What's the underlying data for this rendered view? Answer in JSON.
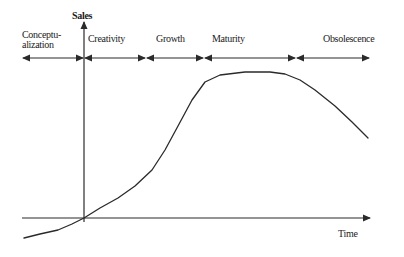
{
  "diagram": {
    "type": "product-life-cycle",
    "axes": {
      "y_label": "Sales",
      "x_label": "Time"
    },
    "phases": [
      {
        "label": "Conceptu-\nalization",
        "start_x": 22,
        "end_x": 84
      },
      {
        "label": "Creativity",
        "start_x": 84,
        "end_x": 146
      },
      {
        "label": "Growth",
        "start_x": 146,
        "end_x": 204
      },
      {
        "label": "Maturity",
        "start_x": 204,
        "end_x": 296
      },
      {
        "label": "Obsolescence",
        "start_x": 296,
        "end_x": 370
      }
    ],
    "curve_points": [
      [
        24,
        238
      ],
      [
        40,
        234
      ],
      [
        58,
        230
      ],
      [
        72,
        224
      ],
      [
        84,
        218
      ],
      [
        100,
        208
      ],
      [
        118,
        198
      ],
      [
        135,
        186
      ],
      [
        152,
        170
      ],
      [
        165,
        150
      ],
      [
        178,
        126
      ],
      [
        192,
        100
      ],
      [
        205,
        82
      ],
      [
        220,
        75
      ],
      [
        245,
        72
      ],
      [
        270,
        72
      ],
      [
        285,
        74
      ],
      [
        300,
        80
      ],
      [
        315,
        90
      ],
      [
        335,
        106
      ],
      [
        352,
        122
      ],
      [
        368,
        138
      ]
    ],
    "colors": {
      "line": "#2a2a2a",
      "background": "#ffffff"
    }
  }
}
